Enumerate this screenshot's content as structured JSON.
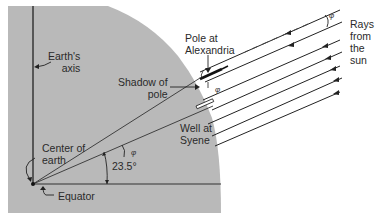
{
  "diagram": {
    "colors": {
      "earth_fill": "#b9b9b9",
      "line": "#222222",
      "background": "#ffffff"
    },
    "labels": {
      "earths_axis": "Earth's\naxis",
      "shadow_of_pole": "Shadow of\npole",
      "pole_at_alexandria": "Pole at\nAlexandria",
      "rays_from_sun": "Rays\nfrom\nthe\nsun",
      "well_at_syene": "Well at\nSyene",
      "center_of_earth": "Center of\nearth",
      "equator": "Equator",
      "latitude_angle": "23.5°",
      "phi_symbol": "φ"
    },
    "angles": {
      "syene_latitude_deg": 23.5,
      "phi_marks": 3
    },
    "rays": {
      "count": 7,
      "direction": "incoming from upper right",
      "arrowheads": true
    }
  }
}
